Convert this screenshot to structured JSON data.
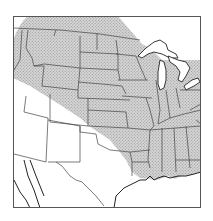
{
  "map": {
    "type": "range-map",
    "region": "Central and Eastern United States",
    "frame": {
      "x": 13,
      "y": 16,
      "width": 188,
      "height": 192
    },
    "colors": {
      "background": "#ffffff",
      "frame": "#555555",
      "borders": "#444444",
      "coast": "#222222",
      "range_fill": "#d0d0d0",
      "stipple_dot": "#9a9a9a",
      "water": "#ffffff"
    },
    "legend": [
      {
        "symbol": "stipple",
        "meaning": "distribution range"
      }
    ]
  }
}
